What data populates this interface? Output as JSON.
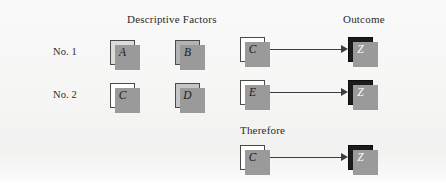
{
  "diagram": {
    "headers": {
      "factors": "Descriptive Factors",
      "outcome": "Outcome",
      "therefore": "Therefore"
    },
    "rows": [
      {
        "label": "No. 1",
        "factors": [
          {
            "text": "A",
            "fill": "light"
          },
          {
            "text": "B",
            "fill": "dark"
          },
          {
            "text": "C",
            "fill": "white"
          }
        ],
        "outcome": {
          "text": "Z",
          "fill": "black"
        },
        "arrow": true
      },
      {
        "label": "No. 2",
        "factors": [
          {
            "text": "C",
            "fill": "white"
          },
          {
            "text": "D",
            "fill": "mid"
          },
          {
            "text": "E",
            "fill": "white"
          }
        ],
        "outcome": {
          "text": "Z",
          "fill": "black"
        },
        "arrow": true
      },
      {
        "label": "",
        "factors": [
          {
            "text": "C",
            "fill": "white"
          }
        ],
        "outcome": {
          "text": "Z",
          "fill": "black"
        },
        "arrow": true
      }
    ],
    "colors": {
      "background": "#f7f7f6",
      "box_border": "#4a4a4a",
      "box_shadow": "#9a9a9a",
      "arrow": "#3d3d3d",
      "text": "#2b2b2b",
      "fill_white": "#ffffff",
      "fill_light": "#dcdcdc",
      "fill_mid": "#c6c6c6",
      "fill_dark": "#b3b3b3",
      "fill_black": "#1b1b1b"
    }
  }
}
